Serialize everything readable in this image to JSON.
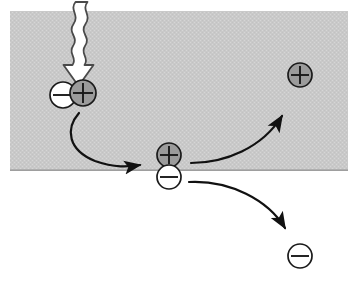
{
  "figure": {
    "canvas": {
      "width": 361,
      "height": 286,
      "background": "#ffffff"
    },
    "regions": [
      {
        "name": "gray-material-band",
        "label": "shaded material layer",
        "x": 10,
        "y": 11,
        "width": 338,
        "height": 160,
        "fill": "#c9c9c9",
        "texture": "dither"
      }
    ],
    "photon_arrow": {
      "name": "wavy-photon-arrow",
      "label": "incident photon",
      "fill": "#ffffff",
      "stroke": "#3a3a3a",
      "start_x": 82,
      "start_y": 2,
      "tip_x": 76,
      "tip_y": 82
    },
    "particles": [
      {
        "name": "electron-bound-left",
        "charge": "−",
        "sign": "minus",
        "cx": 63,
        "cy": 95,
        "r": 13,
        "fill": "#ffffff",
        "stroke": "#1a1a1a"
      },
      {
        "name": "hole-bound-left",
        "charge": "+",
        "sign": "plus",
        "cx": 83,
        "cy": 93,
        "r": 13,
        "fill": "#9b9b9b",
        "stroke": "#1a1a1a"
      },
      {
        "name": "hole-interface-center",
        "charge": "+",
        "sign": "plus",
        "cx": 169,
        "cy": 155,
        "r": 12,
        "fill": "#9b9b9b",
        "stroke": "#1a1a1a"
      },
      {
        "name": "electron-interface-center",
        "charge": "−",
        "sign": "minus",
        "cx": 169,
        "cy": 177,
        "r": 12,
        "fill": "#ffffff",
        "stroke": "#1a1a1a"
      },
      {
        "name": "hole-transported-upper-right",
        "charge": "+",
        "sign": "plus",
        "cx": 300,
        "cy": 75,
        "r": 12,
        "fill": "#9b9b9b",
        "stroke": "#1a1a1a"
      },
      {
        "name": "electron-transported-lower-right",
        "charge": "−",
        "sign": "minus",
        "cx": 300,
        "cy": 256,
        "r": 12,
        "fill": "#ffffff",
        "stroke": "#1a1a1a"
      }
    ],
    "arrows": [
      {
        "name": "exciton-migration-arrow",
        "label": "exciton migrates to interface",
        "path": "M 79,113 C 65,129 68,150 95,161 C 115,168 128,167 140,165",
        "head_x": 152,
        "head_y": 165,
        "stroke": "#111111",
        "stroke_width": 2.2
      },
      {
        "name": "hole-transport-arrow",
        "label": "hole transported up-right",
        "path": "M 191,163 C 225,163 262,148 282,116",
        "head_x": 288,
        "head_y": 104,
        "stroke": "#111111",
        "stroke_width": 2.2
      },
      {
        "name": "electron-transport-arrow",
        "label": "electron transported down-right",
        "path": "M 189,182 C 230,180 268,200 285,228",
        "head_x": 291,
        "head_y": 239,
        "stroke": "#111111",
        "stroke_width": 2.2
      }
    ],
    "colors": {
      "band_fill": "#c9c9c9",
      "positive_fill": "#9b9b9b",
      "negative_fill": "#ffffff",
      "outline": "#1a1a1a",
      "arrow_stroke": "#111111",
      "page_background": "#ffffff"
    }
  }
}
